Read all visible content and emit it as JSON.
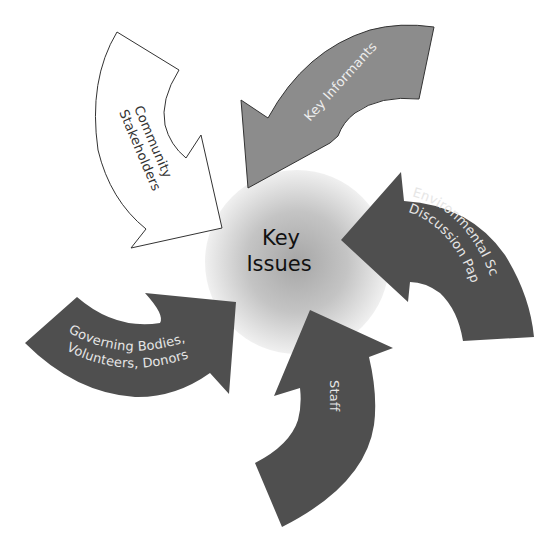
{
  "diagram": {
    "center": {
      "line1": "Key",
      "line2": "Issues",
      "fill_center": "#a9a9a9",
      "fill_edge": "#eeeeee"
    },
    "arrows": [
      {
        "id": "community-stakeholders",
        "line1": "Community",
        "line2": "Stakeholders",
        "fill": "#ffffff",
        "stroke": "#333333",
        "text_color": "#333333"
      },
      {
        "id": "key-informants",
        "line1": "Key Informants",
        "fill": "#8c8c8c",
        "stroke": "#333333",
        "text_color": "#eeeeee"
      },
      {
        "id": "environmental-scan",
        "line1": "Environmental Scan",
        "line2": "Discussion Paper",
        "fill": "#4f4f4f",
        "text_color": "#e6e6e6"
      },
      {
        "id": "staff",
        "line1": "Staff",
        "fill": "#4f4f4f",
        "text_color": "#e6e6e6"
      },
      {
        "id": "governing-bodies",
        "line1": "Governing Bodies,",
        "line2": "Volunteers, Donors",
        "fill": "#4f4f4f",
        "text_color": "#e6e6e6"
      }
    ]
  }
}
